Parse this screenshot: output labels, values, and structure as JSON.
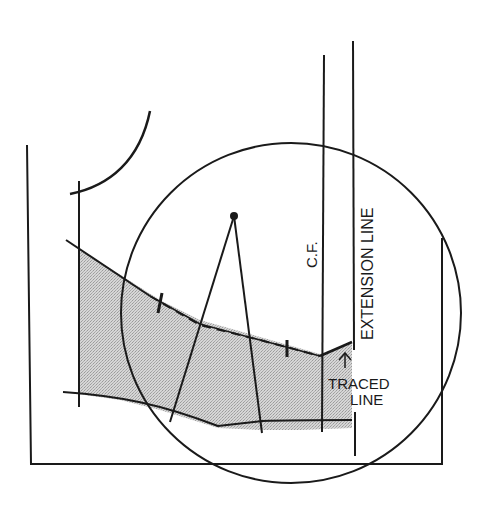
{
  "diagram": {
    "type": "pattern-drafting-illustration",
    "labels": {
      "center_front": "C.F.",
      "extension_line": "EXTENSION LINE",
      "traced_line_1": "TRACED",
      "traced_line_2": "LINE"
    },
    "colors": {
      "ink": "#1a1a1a",
      "shade": "#c8c8c8",
      "background": "#ffffff"
    },
    "shapes": {
      "circle": {
        "cx": 291,
        "cy": 313,
        "r": 170
      },
      "pivot_point": {
        "cx": 234,
        "cy": 216,
        "r": 4
      }
    }
  }
}
